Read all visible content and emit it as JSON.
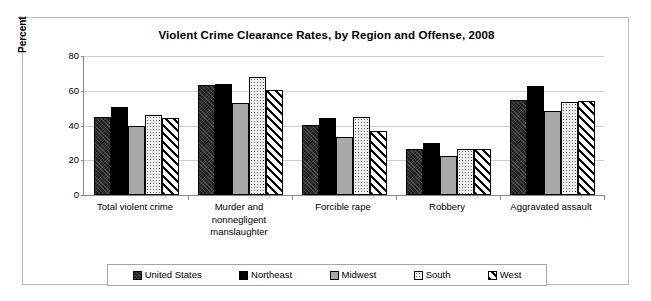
{
  "chart_data": {
    "type": "bar",
    "title": "Violent Crime Clearance Rates, by Region and Offense, 2008",
    "xlabel": "",
    "ylabel": "Percent",
    "ylim": [
      0,
      80
    ],
    "yticks": [
      "0",
      "20",
      "40",
      "60",
      "80"
    ],
    "grid": true,
    "legend_position": "bottom",
    "categories": [
      "Total violent crime",
      "Murder and nonnegligent manslaughter",
      "Forcible rape",
      "Robbery",
      "Aggravated assault"
    ],
    "category_lines": [
      [
        "Total violent crime"
      ],
      [
        "Murder and",
        "nonnegligent",
        "manslaughter"
      ],
      [
        "Forcible rape"
      ],
      [
        "Robbery"
      ],
      [
        "Aggravated assault"
      ]
    ],
    "series": [
      {
        "name": "United States",
        "pattern": "dark-mottled",
        "color": "#1a1a1a",
        "values": [
          45.1,
          63.6,
          40.4,
          26.5,
          54.5
        ]
      },
      {
        "name": "Northeast",
        "pattern": "solid-black",
        "color": "#000000",
        "values": [
          50.4,
          63.9,
          44.2,
          29.9,
          62.9
        ]
      },
      {
        "name": "Midwest",
        "pattern": "solid-gray",
        "color": "#a8a8a8",
        "values": [
          39.8,
          53.0,
          33.6,
          22.5,
          48.6
        ]
      },
      {
        "name": "South",
        "pattern": "light-dotted",
        "color": "#f2f2f2",
        "values": [
          46.0,
          67.8,
          45.0,
          26.4,
          53.8
        ]
      },
      {
        "name": "West",
        "pattern": "diagonal-hatch",
        "color": "#ffffff",
        "values": [
          44.2,
          60.5,
          36.6,
          26.4,
          53.9
        ]
      }
    ]
  },
  "legend": {
    "items": [
      {
        "label": "United States"
      },
      {
        "label": "Northeast"
      },
      {
        "label": "Midwest"
      },
      {
        "label": "South"
      },
      {
        "label": "West"
      }
    ]
  }
}
